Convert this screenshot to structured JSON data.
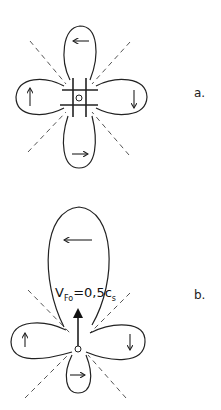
{
  "diagram_a": {
    "label": "a.",
    "lobe_arrows": [
      "left",
      "down",
      "right",
      "up"
    ]
  },
  "diagram_b": {
    "label": "b.",
    "formula": {
      "v": "V",
      "v_sub": "Fo",
      "eq": "=0,5c",
      "c_sub": "s"
    },
    "lobe_arrows": [
      "left",
      "down",
      "right",
      "up"
    ]
  }
}
